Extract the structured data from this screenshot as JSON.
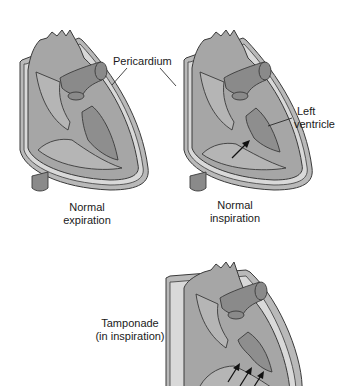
{
  "panels": [
    {
      "id": "normal-expiration",
      "caption_line1": "Normal",
      "caption_line2": "expiration",
      "arrows": 0
    },
    {
      "id": "normal-inspiration",
      "caption_line1": "Normal",
      "caption_line2": "inspiration",
      "arrows": 1
    },
    {
      "id": "tamponade",
      "caption_line1": "Tamponade",
      "caption_line2": "(in inspiration)",
      "arrows": 3
    }
  ],
  "annotations": {
    "pericardium": "Pericardium",
    "left_ventricle_line1": "Left",
    "left_ventricle_line2": "ventricle"
  },
  "colors": {
    "pericardium_outer": "#b9b9b9",
    "pericardial_space": "#d9d9d9",
    "myocardium": "#a6a6a6",
    "chamber": "#b5b5b5",
    "left_ventricle": "#8e8e8e",
    "vessel": "#8a8a8a",
    "outline": "#3a3a3a"
  }
}
